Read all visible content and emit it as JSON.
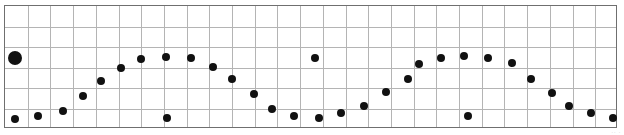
{
  "page": {
    "width": 624,
    "height": 135,
    "background": "#ffffff",
    "artifact_text": "·· ·"
  },
  "plot": {
    "left": 4,
    "top": 5,
    "width": 613,
    "height": 123,
    "border_color": "#6f6f6f",
    "grid_color": "#b4b4b4",
    "marker_color": "#111111"
  },
  "chart_data": {
    "type": "scatter",
    "title": "",
    "subtitle": "",
    "xlabel": "",
    "ylabel": "",
    "legend": [],
    "annotations": [],
    "grid": true,
    "grid_columns": 27,
    "grid_rows": 6,
    "grid_spacing_x_px": 22.7,
    "grid_spacing_y_px": 20.5,
    "xlim": [
      0,
      624
    ],
    "ylim": [
      135,
      0
    ],
    "axis_units": "pixels",
    "marker_default_radius": 4,
    "points": [
      {
        "x": 14,
        "y": 57,
        "r": 7,
        "role": "emphasis"
      },
      {
        "x": 14,
        "y": 118,
        "r": 4,
        "role": "trend"
      },
      {
        "x": 37,
        "y": 115,
        "r": 4,
        "role": "trend"
      },
      {
        "x": 62,
        "y": 110,
        "r": 4,
        "role": "trend"
      },
      {
        "x": 82,
        "y": 95,
        "r": 4,
        "role": "trend"
      },
      {
        "x": 100,
        "y": 80,
        "r": 4,
        "role": "trend"
      },
      {
        "x": 120,
        "y": 67,
        "r": 4,
        "role": "trend"
      },
      {
        "x": 140,
        "y": 58,
        "r": 4,
        "role": "trend"
      },
      {
        "x": 165,
        "y": 56,
        "r": 4,
        "role": "trend"
      },
      {
        "x": 166,
        "y": 117,
        "r": 4,
        "role": "outlier"
      },
      {
        "x": 190,
        "y": 57,
        "r": 4,
        "role": "trend"
      },
      {
        "x": 212,
        "y": 66,
        "r": 4,
        "role": "trend"
      },
      {
        "x": 231,
        "y": 78,
        "r": 4,
        "role": "trend"
      },
      {
        "x": 253,
        "y": 93,
        "r": 4,
        "role": "trend"
      },
      {
        "x": 271,
        "y": 108,
        "r": 4,
        "role": "trend"
      },
      {
        "x": 293,
        "y": 115,
        "r": 4,
        "role": "trend"
      },
      {
        "x": 314,
        "y": 57,
        "r": 4,
        "role": "outlier"
      },
      {
        "x": 318,
        "y": 117,
        "r": 4,
        "role": "trend"
      },
      {
        "x": 340,
        "y": 112,
        "r": 4,
        "role": "trend"
      },
      {
        "x": 363,
        "y": 105,
        "r": 4,
        "role": "trend"
      },
      {
        "x": 385,
        "y": 91,
        "r": 4,
        "role": "trend"
      },
      {
        "x": 407,
        "y": 78,
        "r": 4,
        "role": "trend"
      },
      {
        "x": 418,
        "y": 63,
        "r": 4,
        "role": "trend"
      },
      {
        "x": 440,
        "y": 57,
        "r": 4,
        "role": "trend"
      },
      {
        "x": 463,
        "y": 55,
        "r": 4,
        "role": "trend"
      },
      {
        "x": 467,
        "y": 115,
        "r": 4,
        "role": "outlier"
      },
      {
        "x": 487,
        "y": 57,
        "r": 4,
        "role": "trend"
      },
      {
        "x": 511,
        "y": 62,
        "r": 4,
        "role": "trend"
      },
      {
        "x": 530,
        "y": 78,
        "r": 4,
        "role": "trend"
      },
      {
        "x": 551,
        "y": 92,
        "r": 4,
        "role": "trend"
      },
      {
        "x": 568,
        "y": 105,
        "r": 4,
        "role": "trend"
      },
      {
        "x": 590,
        "y": 112,
        "r": 4,
        "role": "trend"
      },
      {
        "x": 612,
        "y": 117,
        "r": 4,
        "role": "trend"
      }
    ]
  }
}
